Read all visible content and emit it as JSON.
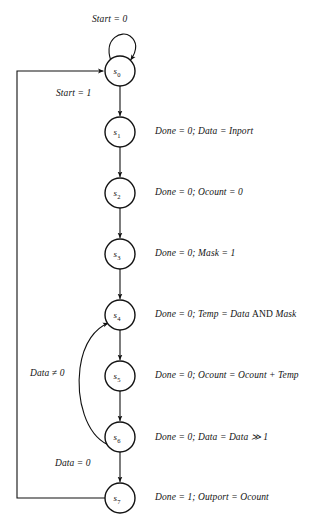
{
  "diagram": {
    "type": "state-transition-diagram",
    "stroke_color": "#111111",
    "background_color": "#ffffff"
  },
  "states": [
    {
      "id": "s0",
      "base": "s",
      "sub": "0",
      "cx": 120,
      "cy": 71,
      "r": 15
    },
    {
      "id": "s1",
      "base": "s",
      "sub": "1",
      "cx": 120,
      "cy": 132,
      "r": 15
    },
    {
      "id": "s2",
      "base": "s",
      "sub": "2",
      "cx": 120,
      "cy": 193,
      "r": 15
    },
    {
      "id": "s3",
      "base": "s",
      "sub": "3",
      "cx": 120,
      "cy": 254,
      "r": 15
    },
    {
      "id": "s4",
      "base": "s",
      "sub": "4",
      "cx": 120,
      "cy": 315,
      "r": 15
    },
    {
      "id": "s5",
      "base": "s",
      "sub": "5",
      "cx": 120,
      "cy": 376,
      "r": 15
    },
    {
      "id": "s6",
      "base": "s",
      "sub": "6",
      "cx": 120,
      "cy": 437,
      "r": 15
    },
    {
      "id": "s7",
      "base": "s",
      "sub": "7",
      "cx": 120,
      "cy": 498,
      "r": 15
    }
  ],
  "edge_labels": [
    {
      "id": "start-0",
      "text": "Start = 0",
      "x": 92,
      "y": 14,
      "for": "s0-self-loop"
    },
    {
      "id": "start-1",
      "text": "Start = 1",
      "x": 56,
      "y": 88,
      "for": "s0-to-s1"
    },
    {
      "id": "data-ne-0",
      "text": "Data ≠ 0",
      "x": 30,
      "y": 368,
      "for": "s6-to-s4"
    },
    {
      "id": "data-eq-0",
      "text": "Data = 0",
      "x": 55,
      "y": 458,
      "for": "s6-to-s7"
    }
  ],
  "action_labels": [
    {
      "state": "s1",
      "x": 155,
      "y": 126,
      "parts": [
        {
          "t": "Done = 0;  Data = Inport",
          "style": "italic"
        }
      ],
      "text": "Done = 0;  Data = Inport"
    },
    {
      "state": "s2",
      "x": 155,
      "y": 187,
      "parts": [
        {
          "t": "Done = 0;  Ocount = 0",
          "style": "italic"
        }
      ],
      "text": "Done = 0;  Ocount = 0"
    },
    {
      "state": "s3",
      "x": 155,
      "y": 248,
      "parts": [
        {
          "t": "Done = 0;  Mask = 1",
          "style": "italic"
        }
      ],
      "text": "Done = 0;  Mask = 1"
    },
    {
      "state": "s4",
      "x": 155,
      "y": 309,
      "parts": [
        {
          "t": "Done = 0;  Temp = Data ",
          "style": "italic"
        },
        {
          "t": "AND",
          "style": "roman"
        },
        {
          "t": " Mask",
          "style": "italic"
        }
      ],
      "text": "Done = 0;  Temp = Data AND Mask"
    },
    {
      "state": "s5",
      "x": 155,
      "y": 370,
      "parts": [
        {
          "t": "Done = 0;  Ocount = Ocount + Temp",
          "style": "italic"
        }
      ],
      "text": "Done = 0;  Ocount = Ocount + Temp"
    },
    {
      "state": "s6",
      "x": 155,
      "y": 431,
      "parts": [
        {
          "t": "Done = 0;  Data = Data ≫ 1",
          "style": "italic"
        }
      ],
      "text": "Done = 0;  Data = Data ≫ 1"
    },
    {
      "state": "s7",
      "x": 155,
      "y": 492,
      "parts": [
        {
          "t": "Done = 1;  Outport = Ocount",
          "style": "italic"
        }
      ],
      "text": "Done = 1;  Outport = Ocount"
    }
  ],
  "transitions": [
    {
      "id": "s0-self-loop",
      "from": "s0",
      "to": "s0",
      "label": "Start = 0"
    },
    {
      "id": "s0-to-s1",
      "from": "s0",
      "to": "s1",
      "label": "Start = 1"
    },
    {
      "id": "s1-to-s2",
      "from": "s1",
      "to": "s2",
      "label": ""
    },
    {
      "id": "s2-to-s3",
      "from": "s2",
      "to": "s3",
      "label": ""
    },
    {
      "id": "s3-to-s4",
      "from": "s3",
      "to": "s4",
      "label": ""
    },
    {
      "id": "s4-to-s5",
      "from": "s4",
      "to": "s5",
      "label": ""
    },
    {
      "id": "s5-to-s6",
      "from": "s5",
      "to": "s6",
      "label": ""
    },
    {
      "id": "s6-to-s4",
      "from": "s6",
      "to": "s4",
      "label": "Data ≠ 0"
    },
    {
      "id": "s6-to-s7",
      "from": "s6",
      "to": "s7",
      "label": "Data = 0"
    },
    {
      "id": "s7-to-s0",
      "from": "s7",
      "to": "s0",
      "label": ""
    }
  ]
}
